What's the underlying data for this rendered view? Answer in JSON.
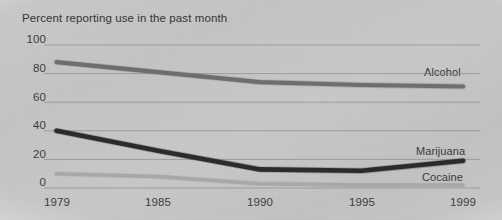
{
  "chart_data": {
    "type": "line",
    "title": "Percent reporting use in the past month",
    "xlabel": "",
    "ylabel": "",
    "x": [
      1979,
      1985,
      1990,
      1995,
      1999
    ],
    "xtick_labels": [
      "1979",
      "1985",
      "1990",
      "1995",
      "1999"
    ],
    "ytick_labels": [
      "0",
      "20",
      "40",
      "60",
      "80",
      "100"
    ],
    "yticks": [
      0,
      20,
      40,
      60,
      80,
      100
    ],
    "ylim": [
      0,
      100
    ],
    "xlim": [
      1979,
      1999
    ],
    "grid": true,
    "legend_position": "right-inline",
    "series": [
      {
        "name": "Alcohol",
        "color": "#6e6e6e",
        "values": [
          88,
          81,
          74,
          72,
          71
        ]
      },
      {
        "name": "Marijuana",
        "color": "#2b2b2b",
        "values": [
          40,
          26,
          13,
          12,
          19
        ]
      },
      {
        "name": "Cocaine",
        "color": "#a8a8a8",
        "values": [
          10,
          8,
          3,
          2,
          2
        ]
      }
    ]
  },
  "axis": {
    "y_ticks": [
      {
        "label": "100",
        "value": 100
      },
      {
        "label": "80",
        "value": 80
      },
      {
        "label": "60",
        "value": 60
      },
      {
        "label": "40",
        "value": 40
      },
      {
        "label": "20",
        "value": 20
      },
      {
        "label": "0",
        "value": 0
      }
    ],
    "x_ticks": [
      {
        "label": "1979",
        "value": 1979
      },
      {
        "label": "1985",
        "value": 1985
      },
      {
        "label": "1990",
        "value": 1990
      },
      {
        "label": "1995",
        "value": 1995
      },
      {
        "label": "1999",
        "value": 1999
      }
    ]
  },
  "legend": {
    "alcohol": "Alcohol",
    "marijuana": "Marijuana",
    "cocaine": "Cocaine"
  },
  "colors": {
    "alcohol_line": "#6e6e6e",
    "marijuana_line": "#2b2b2b",
    "cocaine_line": "#a8a8a8",
    "gridline": "#8f8f8f",
    "text": "#3b3b3b",
    "background": "#c6c6c6"
  }
}
